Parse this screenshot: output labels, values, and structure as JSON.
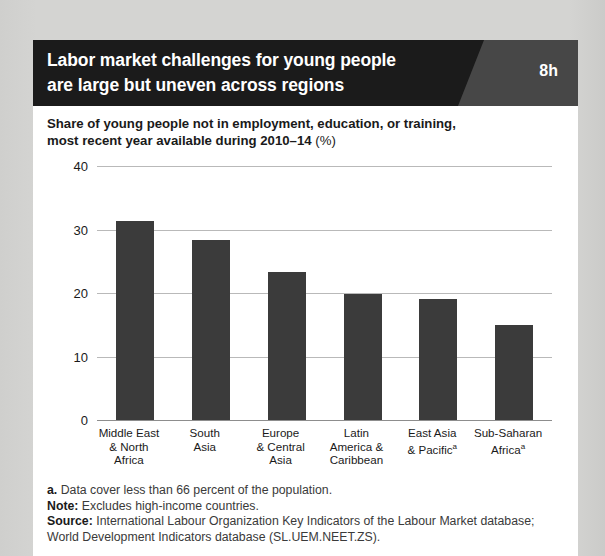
{
  "header": {
    "title_line1": "Labor market challenges for young people",
    "title_line2": "are large but uneven across regions",
    "badge": "8h"
  },
  "subtitle": {
    "line1": "Share of young people not in employment, education, or training,",
    "line2_bold": "most recent year available during 2010–14 ",
    "line2_light": "(%)"
  },
  "notes": {
    "footnote_label": "a.",
    "footnote_text": " Data cover less than 66 percent of the population.",
    "note_label": "Note:",
    "note_text": " Excludes high-income countries.",
    "source_label": "Source:",
    "source_text": " International Labour Organization Key Indicators of the Labour Market database; World Development Indicators database (SL.UEM.NEET.ZS)."
  },
  "colors": {
    "bar": "#3b3b3b",
    "header": "#1b1b1b",
    "header_accent": "#474747",
    "grid": "#b9b9b9",
    "page_background": "#d2d2d0",
    "card": "#ffffff"
  },
  "chart_data": {
    "type": "bar",
    "title": "Labor market challenges for young people are large but uneven across regions",
    "subtitle": "Share of young people not in employment, education, or training, most recent year available during 2010–14 (%)",
    "categories": [
      "Middle East & North Africa",
      "South Asia",
      "Europe & Central Asia",
      "Latin America & Caribbean",
      "East Asia & Pacificᵃ",
      "Sub-Saharan Africaᵃ"
    ],
    "category_lines": [
      [
        "Middle East",
        "& North",
        "Africa"
      ],
      [
        "South",
        "Asia"
      ],
      [
        "Europe",
        "& Central",
        "Asia"
      ],
      [
        "Latin",
        "America &",
        "Caribbean"
      ],
      [
        "East Asia",
        "& Pacific",
        ""
      ],
      [
        "Sub-Saharan",
        "Africa",
        ""
      ]
    ],
    "category_superscripts": [
      "",
      "",
      "",
      "",
      "a",
      "a"
    ],
    "superscript_line_index": [
      -1,
      -1,
      -1,
      -1,
      1,
      1
    ],
    "values": [
      31.3,
      28.3,
      23.3,
      19.8,
      19.0,
      15.0
    ],
    "xlabel": "",
    "ylabel": "",
    "ylim": [
      0,
      40
    ],
    "yticks": [
      0,
      10,
      20,
      30,
      40
    ],
    "ytick_labels": [
      "0",
      "10",
      "20",
      "30",
      "40"
    ],
    "grid": true,
    "legend": false
  }
}
